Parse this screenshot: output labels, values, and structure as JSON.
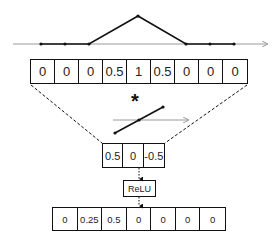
{
  "signal_plot": {
    "shape": "triangle",
    "points_y": [
      0,
      0,
      0,
      0.5,
      1,
      0.5,
      0,
      0,
      0
    ]
  },
  "input_sequence": {
    "values": [
      "0",
      "0",
      "0",
      "0.5",
      "1",
      "0.5",
      "0",
      "0",
      "0"
    ]
  },
  "operator": {
    "symbol": "*"
  },
  "kernel_plot": {
    "shape": "decreasing-line"
  },
  "kernel": {
    "values": [
      "0.5",
      "0",
      "-0.5"
    ]
  },
  "activation": {
    "label": "ReLU"
  },
  "output_sequence": {
    "values": [
      "0",
      "0.25",
      "0.5",
      "0",
      "0",
      "0",
      "0"
    ]
  },
  "colors": {
    "line": "#111111",
    "axis": "#9a9a9a",
    "background": "#ffffff"
  }
}
